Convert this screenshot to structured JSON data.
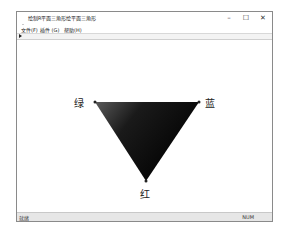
{
  "window": {
    "title": "绘制R平面三角形绘平面三角形",
    "controls": {
      "minimize": "–",
      "maximize": "☐",
      "close": "✕"
    }
  },
  "menubar": {
    "items": [
      {
        "label": "文件(F)"
      },
      {
        "label": "插件 (G)"
      },
      {
        "label": "帮助(H)"
      }
    ]
  },
  "canvas": {
    "triangle": {
      "vertices": [
        {
          "name": "green",
          "label": "绿",
          "color": "#555555"
        },
        {
          "name": "blue",
          "label": "蓝",
          "color": "#000000"
        },
        {
          "name": "red",
          "label": "红",
          "color": "#1a1a1a"
        }
      ],
      "fill_color": "#0a0a0a"
    }
  },
  "statusbar": {
    "left": "就绪",
    "right": "NUM"
  }
}
